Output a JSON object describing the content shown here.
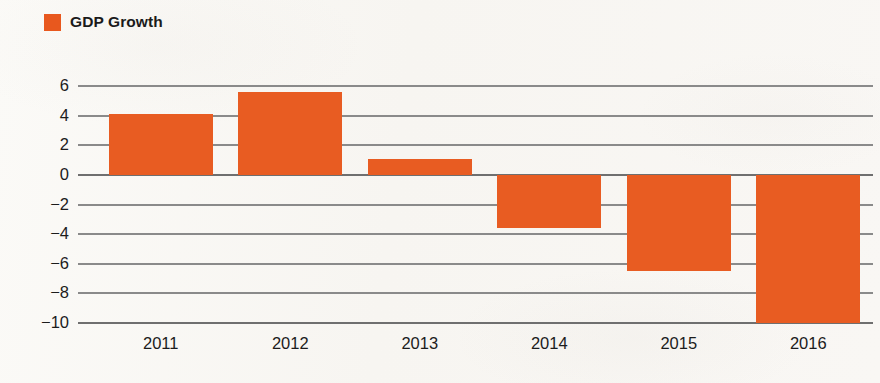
{
  "legend": {
    "swatch_color": "#e8581e",
    "label": "GDP Growth"
  },
  "chart_data": {
    "type": "bar",
    "title": "",
    "xlabel": "",
    "ylabel": "",
    "categories": [
      "2011",
      "2012",
      "2013",
      "2014",
      "2015",
      "2016"
    ],
    "series": [
      {
        "name": "GDP Growth",
        "color": "#e85c22",
        "values": [
          4.1,
          5.6,
          1.1,
          -3.6,
          -6.5,
          -10.0
        ]
      }
    ],
    "ylim": [
      -10,
      6
    ],
    "yticks": [
      6,
      4,
      2,
      0,
      -2,
      -4,
      -6,
      -8,
      -10
    ],
    "ytick_labels": [
      "6",
      "4",
      "2",
      "0",
      "−2",
      "−4",
      "−6",
      "−8",
      "−10"
    ],
    "grid": true,
    "legend_position": "top-left"
  }
}
